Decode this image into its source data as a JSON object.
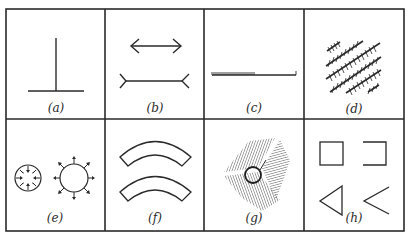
{
  "figure": {
    "panels": [
      {
        "id": "a",
        "label": "(a)",
        "description": "vertical-horizontal illusion (inverted T)"
      },
      {
        "id": "b",
        "label": "(b)",
        "description": "Muller-Lyer illusion"
      },
      {
        "id": "c",
        "label": "(c)",
        "description": "Oppel-Kundt filled-space line"
      },
      {
        "id": "d",
        "label": "(d)",
        "description": "Zollner hatched diagonal lines"
      },
      {
        "id": "e",
        "label": "(e)",
        "description": "Delboeuf circles with inward and outward arrows"
      },
      {
        "id": "f",
        "label": "(f)",
        "description": "Jastrow arcs illusion"
      },
      {
        "id": "g",
        "label": "(g)",
        "description": "circle on shaded converging background"
      },
      {
        "id": "h",
        "label": "(h)",
        "description": "complete vs incomplete square and triangle"
      }
    ],
    "colors": {
      "ink": "#2a2a2a",
      "background": "#ffffff",
      "hatch": "#555555"
    }
  }
}
